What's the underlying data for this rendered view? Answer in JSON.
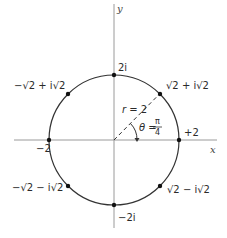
{
  "figure": {
    "axes": {
      "x_label": "x",
      "y_label": "y"
    },
    "circle": {
      "radius_label": "r = 2",
      "angle_label_lhs": "θ =",
      "angle_num": "π",
      "angle_den": "4"
    },
    "points": [
      {
        "id": "p0",
        "label": "+2"
      },
      {
        "id": "p1",
        "label": "√2 + i√2"
      },
      {
        "id": "p2",
        "label": "2i"
      },
      {
        "id": "p3",
        "label": "−√2 + i√2"
      },
      {
        "id": "p4",
        "label": "−2"
      },
      {
        "id": "p5",
        "label": "−√2 − i√2"
      },
      {
        "id": "p6",
        "label": "−2i"
      },
      {
        "id": "p7",
        "label": "√2 − i√2"
      }
    ],
    "colors": {
      "axis": "#9a9a9a",
      "circle": "#333333",
      "point": "#111111",
      "text": "#2a2a2a"
    }
  }
}
